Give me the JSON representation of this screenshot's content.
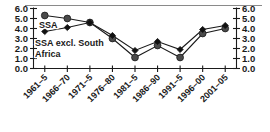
{
  "chart_data": {
    "type": "line",
    "title": "",
    "subtitle": "",
    "xlabel": "",
    "ylabel": "",
    "ylim": [
      0.0,
      6.0
    ],
    "yticks": [
      "0.0",
      "1.0",
      "2.0",
      "3.0",
      "4.0",
      "5.0",
      "6.0"
    ],
    "ytick_values": [
      0.0,
      1.0,
      2.0,
      3.0,
      4.0,
      5.0,
      6.0
    ],
    "grid": false,
    "dual_y_axis": true,
    "right_axis_yticks": [
      "0.0",
      "1.0",
      "2.0",
      "3.0",
      "4.0",
      "5.0",
      "6.0"
    ],
    "legend_position": "inside-top-left",
    "categories": [
      "1961–5",
      "1966–70",
      "1971–5",
      "1976–80",
      "1981–5",
      "1986–90",
      "1991–5",
      "1996–00",
      "2001–05"
    ],
    "series": [
      {
        "name": "SSA",
        "marker": "circle",
        "color": "#4a4a4a",
        "values": [
          5.3,
          5.0,
          4.6,
          3.0,
          1.1,
          2.3,
          1.1,
          3.5,
          4.0
        ]
      },
      {
        "name": "SSA excl. South Africa",
        "marker": "diamond",
        "color": "#111111",
        "values": [
          3.7,
          4.1,
          4.6,
          3.3,
          1.8,
          2.7,
          1.9,
          3.9,
          4.3
        ]
      }
    ],
    "annotations": [
      {
        "text": "SSA",
        "series": "SSA"
      },
      {
        "text": "SSA excl. South",
        "series": "SSA excl. South Africa"
      },
      {
        "text": "Africa",
        "series": "SSA excl. South Africa"
      }
    ]
  },
  "legend": {
    "series_1_label": "SSA",
    "series_2_label_line1": "SSA excl. South",
    "series_2_label_line2": "Africa"
  },
  "colors": {
    "axis": "#1a1a1a",
    "series_ssa": "#4a4a4a",
    "series_ssa_excl": "#111111",
    "background": "#ffffff",
    "top_rule": "#8a8a8a"
  }
}
